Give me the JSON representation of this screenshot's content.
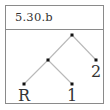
{
  "card": {
    "title": "5.30.b"
  },
  "tree": {
    "nodes": [
      {
        "id": "root",
        "x": 72,
        "y": 35,
        "label": ""
      },
      {
        "id": "left",
        "x": 48,
        "y": 60,
        "label": ""
      },
      {
        "id": "right",
        "x": 96,
        "y": 60,
        "label": "2"
      },
      {
        "id": "leaf-r",
        "x": 24,
        "y": 84,
        "label": "R"
      },
      {
        "id": "leaf-1",
        "x": 72,
        "y": 84,
        "label": "1"
      }
    ],
    "edges": [
      [
        "root",
        "left"
      ],
      [
        "root",
        "right"
      ],
      [
        "left",
        "leaf-r"
      ],
      [
        "left",
        "leaf-1"
      ]
    ],
    "labels": {
      "right": "2",
      "leaf_r": "R",
      "leaf_1": "1"
    },
    "colors": {
      "edge": "#b0b0b0",
      "node": "#111111"
    }
  }
}
